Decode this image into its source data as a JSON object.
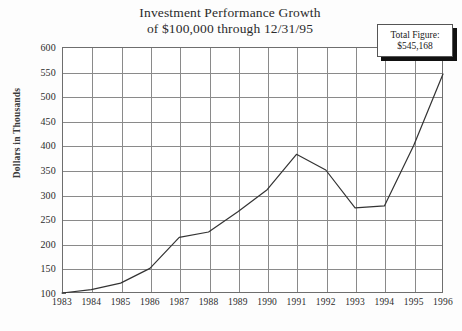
{
  "chart_data": {
    "type": "line",
    "title": "Investment Performance Growth of $100,000 through 12/31/95",
    "title_line1": "Investment Performance Growth",
    "title_line2": "of $100,000 through 12/31/95",
    "xlabel": "",
    "ylabel": "Dollars in Thousands",
    "categories": [
      "1983",
      "1984",
      "1985",
      "1986",
      "1987",
      "1988",
      "1989",
      "1990",
      "1991",
      "1992",
      "1993",
      "1994",
      "1995",
      "1996"
    ],
    "values": [
      100,
      107,
      120,
      150,
      213,
      224,
      265,
      310,
      382,
      350,
      273,
      277,
      400,
      545
    ],
    "ylim": [
      100,
      600
    ],
    "yticks": [
      100,
      150,
      200,
      250,
      300,
      350,
      400,
      450,
      500,
      550,
      600
    ],
    "grid": true,
    "legend": "none",
    "series": [
      {
        "name": "Investment value",
        "values": [
          100,
          107,
          120,
          150,
          213,
          224,
          265,
          310,
          382,
          350,
          273,
          277,
          400,
          545
        ]
      }
    ],
    "annotations": [
      {
        "name": "total-figure",
        "label": "Total Figure:",
        "value": "$545,168",
        "position": "top-right"
      }
    ],
    "colors": {
      "line": "#333333",
      "grid": "#8a8a8a",
      "axis": "#6e6e6e",
      "background": "#ffffff",
      "text": "#1a1a1a",
      "shadow": "#111111"
    }
  }
}
